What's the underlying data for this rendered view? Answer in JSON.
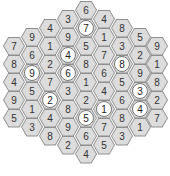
{
  "puzzle": {
    "type": "hex-number-grid",
    "columns": [
      {
        "x": 14,
        "y0": 46,
        "cells": [
          {
            "v": "7"
          },
          {
            "v": "8"
          },
          {
            "v": "4"
          },
          {
            "v": "9"
          },
          {
            "v": "5"
          }
        ]
      },
      {
        "x": 32,
        "y0": 37,
        "cells": [
          {
            "v": "9"
          },
          {
            "v": "6"
          },
          {
            "v": "9",
            "c": true
          },
          {
            "v": "5"
          },
          {
            "v": "1"
          },
          {
            "v": "3"
          }
        ]
      },
      {
        "x": 50,
        "y0": 28,
        "cells": [
          {
            "v": "4"
          },
          {
            "v": "1"
          },
          {
            "v": "2"
          },
          {
            "v": "7"
          },
          {
            "v": "2",
            "c": true
          },
          {
            "v": "4"
          },
          {
            "v": "8"
          }
        ]
      },
      {
        "x": 68,
        "y0": 19,
        "cells": [
          {
            "v": "3"
          },
          {
            "v": "9"
          },
          {
            "v": "4",
            "c": true
          },
          {
            "v": "6",
            "c": true
          },
          {
            "v": "3"
          },
          {
            "v": "8"
          },
          {
            "v": "9"
          },
          {
            "v": "2"
          }
        ]
      },
      {
        "x": 86,
        "y0": 10,
        "cells": [
          {
            "v": "6"
          },
          {
            "v": "7",
            "c": true
          },
          {
            "v": "5"
          },
          {
            "v": "8"
          },
          {
            "v": "1"
          },
          {
            "v": "2"
          },
          {
            "v": "5",
            "c": true
          },
          {
            "v": "6"
          },
          {
            "v": "4"
          }
        ]
      },
      {
        "x": 104,
        "y0": 19,
        "cells": [
          {
            "v": "4"
          },
          {
            "v": "1"
          },
          {
            "v": "7"
          },
          {
            "v": "6"
          },
          {
            "v": "4"
          },
          {
            "v": "1",
            "c": true
          },
          {
            "v": "7"
          },
          {
            "v": "5"
          }
        ]
      },
      {
        "x": 122,
        "y0": 28,
        "cells": [
          {
            "v": "8"
          },
          {
            "v": "3"
          },
          {
            "v": "8",
            "c": true
          },
          {
            "v": "5"
          },
          {
            "v": "6"
          },
          {
            "v": "8"
          },
          {
            "v": "3"
          }
        ]
      },
      {
        "x": 140,
        "y0": 37,
        "cells": [
          {
            "v": "5"
          },
          {
            "v": "2"
          },
          {
            "v": "9"
          },
          {
            "v": "3",
            "c": true
          },
          {
            "v": "4",
            "c": true
          },
          {
            "v": "1"
          }
        ]
      },
      {
        "x": 157,
        "y0": 46,
        "cells": [
          {
            "v": "9"
          },
          {
            "v": "1"
          },
          {
            "v": "8"
          },
          {
            "v": "2"
          },
          {
            "v": "7"
          }
        ]
      }
    ],
    "row_step": 18
  }
}
